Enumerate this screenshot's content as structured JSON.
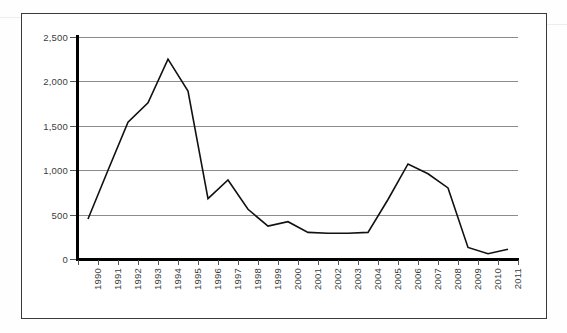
{
  "chart_data": {
    "type": "line",
    "title": "",
    "xlabel": "",
    "ylabel": "",
    "categories": [
      "1990",
      "1991",
      "1992",
      "1993",
      "1994",
      "1995",
      "1996",
      "1997",
      "1998",
      "1999",
      "2000",
      "2001",
      "2002",
      "2003",
      "2004",
      "2005",
      "2006",
      "2007",
      "2008",
      "2009",
      "2010",
      "2011"
    ],
    "values": [
      450,
      1000,
      1540,
      1760,
      2250,
      1890,
      680,
      890,
      560,
      370,
      420,
      300,
      290,
      290,
      300,
      670,
      1070,
      960,
      800,
      130,
      60,
      110
    ],
    "ylim": [
      0,
      2500
    ],
    "ytick_values": [
      0,
      500,
      1000,
      1500,
      2000,
      2500
    ],
    "ytick_labels": [
      "0",
      "500",
      "1,000",
      "1,500",
      "2,000",
      "2,500"
    ],
    "grid": true,
    "legend": false,
    "series_color": "#111111",
    "gridline_color": "#8c8c8c",
    "axis_color": "#000000"
  },
  "page": {
    "border_color": "#3a3a3a",
    "background": "#ffffff"
  }
}
